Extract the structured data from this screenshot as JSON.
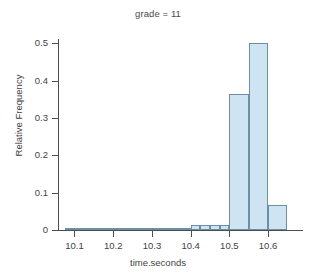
{
  "chart_data": {
    "type": "bar",
    "title": "grade = 11",
    "xlabel": "time.seconds",
    "ylabel": "Relative Frequency",
    "xlim": [
      10.06,
      10.685
    ],
    "ylim": [
      0,
      0.52
    ],
    "grid": false,
    "legend": null,
    "bin_width": 0.025,
    "x_ticks": [
      {
        "value": 10.1,
        "label": "10.1"
      },
      {
        "value": 10.2,
        "label": "10.2"
      },
      {
        "value": 10.3,
        "label": "10.3"
      },
      {
        "value": 10.4,
        "label": "10.4"
      },
      {
        "value": 10.5,
        "label": "10.5"
      },
      {
        "value": 10.6,
        "label": "10.6"
      }
    ],
    "y_ticks": [
      {
        "value": 0,
        "label": "0"
      },
      {
        "value": 0.1,
        "label": "0.1"
      },
      {
        "value": 0.2,
        "label": "0.2"
      },
      {
        "value": 0.3,
        "label": "0.3"
      },
      {
        "value": 0.4,
        "label": "0.4"
      },
      {
        "value": 0.5,
        "label": "0.5"
      }
    ],
    "bins": [
      {
        "x0": 10.075,
        "x1": 10.1,
        "value": 0.0
      },
      {
        "x0": 10.1,
        "x1": 10.125,
        "value": 0.002
      },
      {
        "x0": 10.125,
        "x1": 10.15,
        "value": 0.002
      },
      {
        "x0": 10.15,
        "x1": 10.175,
        "value": 0.0
      },
      {
        "x0": 10.175,
        "x1": 10.2,
        "value": 0.003
      },
      {
        "x0": 10.2,
        "x1": 10.225,
        "value": 0.004
      },
      {
        "x0": 10.225,
        "x1": 10.25,
        "value": 0.004
      },
      {
        "x0": 10.25,
        "x1": 10.275,
        "value": 0.004
      },
      {
        "x0": 10.275,
        "x1": 10.3,
        "value": 0.004
      },
      {
        "x0": 10.3,
        "x1": 10.325,
        "value": 0.004
      },
      {
        "x0": 10.325,
        "x1": 10.35,
        "value": 0.004
      },
      {
        "x0": 10.35,
        "x1": 10.375,
        "value": 0.003
      },
      {
        "x0": 10.375,
        "x1": 10.4,
        "value": 0.004
      },
      {
        "x0": 10.4,
        "x1": 10.425,
        "value": 0.013
      },
      {
        "x0": 10.425,
        "x1": 10.45,
        "value": 0.013
      },
      {
        "x0": 10.45,
        "x1": 10.475,
        "value": 0.013
      },
      {
        "x0": 10.475,
        "x1": 10.5,
        "value": 0.013
      },
      {
        "x0": 10.5,
        "x1": 10.55,
        "value": 0.364
      },
      {
        "x0": 10.55,
        "x1": 10.6,
        "value": 0.502
      },
      {
        "x0": 10.6,
        "x1": 10.65,
        "value": 0.066
      }
    ],
    "colors": {
      "bar_fill": "#cfe4f3",
      "bar_edge": "#6d8ea5",
      "axis": "#4d4d4d",
      "text": "#3f3f3f",
      "background": "#ffffff"
    }
  }
}
